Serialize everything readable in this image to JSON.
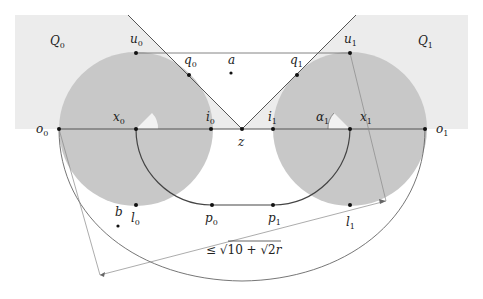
{
  "diagram": {
    "colors": {
      "region_fill": "#ececec",
      "disk_fill": "#c8c8c8",
      "line": "#555555",
      "thin_line": "#888888",
      "point": "#111111",
      "text": "#222222"
    },
    "regions": [
      {
        "label": "Q",
        "sub": "0"
      },
      {
        "label": "Q",
        "sub": "1"
      }
    ],
    "points": {
      "u0": {
        "label": "u",
        "sub": "0"
      },
      "u1": {
        "label": "u",
        "sub": "1"
      },
      "q0": {
        "label": "q",
        "sub": "0"
      },
      "q1": {
        "label": "q",
        "sub": "1"
      },
      "a": {
        "label": "a"
      },
      "o0": {
        "label": "o",
        "sub": "0"
      },
      "x0": {
        "label": "x",
        "sub": "0"
      },
      "i0": {
        "label": "i",
        "sub": "0"
      },
      "z": {
        "label": "z"
      },
      "i1": {
        "label": "i",
        "sub": "1"
      },
      "alpha1": {
        "label": "α",
        "sub": "1"
      },
      "x1": {
        "label": "x",
        "sub": "1"
      },
      "o1": {
        "label": "o",
        "sub": "1"
      },
      "b": {
        "label": "b"
      },
      "l0": {
        "label": "l",
        "sub": "0"
      },
      "p0": {
        "label": "p",
        "sub": "0"
      },
      "p1": {
        "label": "p",
        "sub": "1"
      },
      "l1": {
        "label": "l",
        "sub": "1"
      }
    },
    "annotation": {
      "prefix": "≤ √",
      "inner": "10 + √2",
      "suffix": "r"
    }
  }
}
